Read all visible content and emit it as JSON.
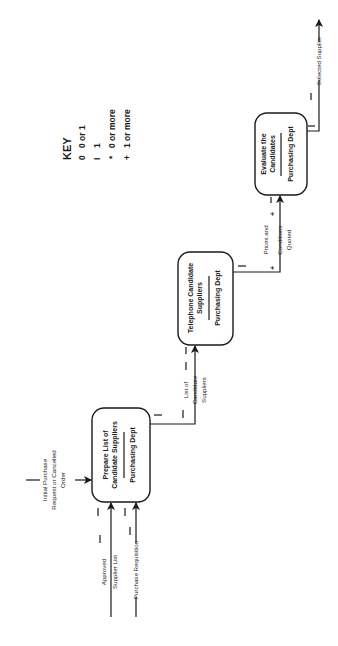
{
  "diagram": {
    "orientation": "rotated -90deg (reads bottom-to-top)",
    "key": {
      "title": "KEY",
      "items": [
        {
          "symbol": "0",
          "label": "0 or 1"
        },
        {
          "symbol": "I",
          "label": "1"
        },
        {
          "symbol": "*",
          "label": "0 or more"
        },
        {
          "symbol": "+",
          "label": "1 or more"
        }
      ]
    },
    "processes": [
      {
        "id": "p1",
        "title_line1": "Prepare List of",
        "title_line2": "Candidate Suppliers",
        "dept": "Purchasing Dept"
      },
      {
        "id": "p2",
        "title_line1": "Telephone Candidate",
        "title_line2": "Suppliers",
        "dept": "Purchasing Dept"
      },
      {
        "id": "p3",
        "title_line1": "Evaluate the",
        "title_line2": "Candidates",
        "dept": "Purchasing Dept"
      }
    ],
    "flows": {
      "initial": {
        "line1": "Initial Purchase",
        "line2": "Request or Cancelled",
        "line3": "Order",
        "cardinality": "I"
      },
      "approved": {
        "line1": "Approved",
        "line2": "Supplier List",
        "cardinality": "I"
      },
      "requisition": {
        "label": "Purchase Requisition",
        "cardinality": "I"
      },
      "candidates": {
        "line1": "List of",
        "line2": "Candidate",
        "line3": "Suppliers",
        "cardinality": "I"
      },
      "prices": {
        "line1": "Prices and",
        "line2": "Conditions",
        "line3": "Quoted",
        "cardinality": "+"
      },
      "selected": {
        "label": "Selected Supplier",
        "cardinality": "I"
      }
    }
  }
}
